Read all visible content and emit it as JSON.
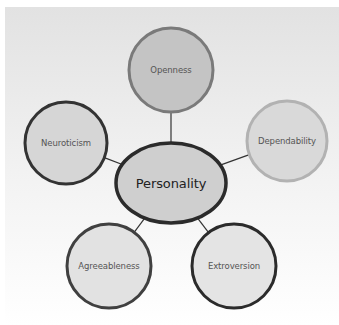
{
  "diagram": {
    "type": "mind-map",
    "background": {
      "top_color": "#e2e2e2",
      "bottom_color": "#ffffff"
    },
    "center": {
      "label": "Personality",
      "cx": 171,
      "cy": 183,
      "rx": 55,
      "ry": 40,
      "fill": "#cfcfcf",
      "stroke": "#2b2b2b",
      "stroke_width": 3.5
    },
    "nodes": [
      {
        "id": "openness",
        "label": "Openness",
        "cx": 171,
        "cy": 70,
        "r": 42,
        "fill": "#c4c4c4",
        "stroke": "#7a7a7a",
        "stroke_width": 3
      },
      {
        "id": "neuroticism",
        "label": "Neuroticism",
        "cx": 66,
        "cy": 143,
        "r": 41,
        "fill": "#d6d6d6",
        "stroke": "#333333",
        "stroke_width": 3
      },
      {
        "id": "dependability",
        "label": "Dependability",
        "cx": 287,
        "cy": 141,
        "r": 40,
        "fill": "#d9d9d9",
        "stroke": "#b2b2b2",
        "stroke_width": 3
      },
      {
        "id": "agreeableness",
        "label": "Agreeableness",
        "cx": 109,
        "cy": 266,
        "r": 42,
        "fill": "#e2e2e2",
        "stroke": "#404040",
        "stroke_width": 3
      },
      {
        "id": "extroversion",
        "label": "Extroversion",
        "cx": 234,
        "cy": 266,
        "r": 42,
        "fill": "#e4e4e4",
        "stroke": "#2b2b2b",
        "stroke_width": 3
      }
    ],
    "connector_color": "#333333"
  }
}
